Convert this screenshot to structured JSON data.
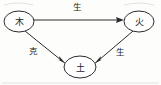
{
  "diagram": {
    "background_color": "#fdfdfc",
    "stroke_color": "#2b2b2b",
    "nodes": [
      {
        "id": "wood",
        "label": "木",
        "cx": 19,
        "cy": 21.5,
        "rx": 15,
        "ry": 10.5
      },
      {
        "id": "fire",
        "label": "火",
        "cx": 139,
        "cy": 21.5,
        "rx": 15,
        "ry": 10.5
      },
      {
        "id": "earth",
        "label": "土",
        "cx": 80,
        "cy": 67,
        "rx": 16,
        "ry": 11
      }
    ],
    "edges": [
      {
        "id": "wood-to-fire",
        "label": "生",
        "from": "wood",
        "to": "fire",
        "label_x": 77,
        "label_y": 7
      },
      {
        "id": "wood-to-earth",
        "label": "克",
        "from": "wood",
        "to": "earth",
        "label_x": 33,
        "label_y": 51
      },
      {
        "id": "fire-to-earth",
        "label": "生",
        "from": "fire",
        "to": "earth",
        "label_x": 120,
        "label_y": 52
      }
    ]
  }
}
